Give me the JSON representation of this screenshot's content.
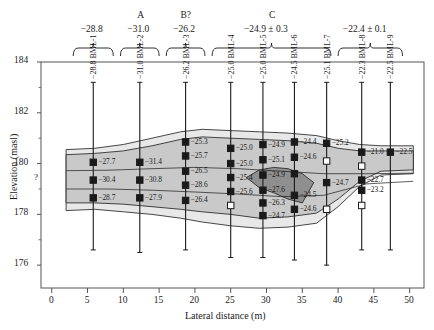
{
  "figure": {
    "type": "geological-cross-section",
    "y_axis": {
      "title": "Elevation (masl)",
      "ticks": [
        176,
        178,
        180,
        182,
        184
      ],
      "min": 175.1,
      "max": 184
    },
    "x_axis": {
      "title": "Lateral distance (m)",
      "ticks": [
        0,
        5,
        10,
        15,
        20,
        25,
        30,
        35,
        40,
        45,
        50
      ],
      "min": -1.5,
      "max": 52
    },
    "uncertainty_marker": "?"
  },
  "groups": [
    {
      "name": "",
      "value": "−28.8",
      "x_start": 3.0,
      "x_end": 8.6
    },
    {
      "name": "A",
      "value": "−31.0",
      "x_start": 9.6,
      "x_end": 15.0
    },
    {
      "name": "B?",
      "value": "−26.2",
      "x_start": 16.0,
      "x_end": 21.4
    },
    {
      "name": "C",
      "value": "−24.9 ± 0.3",
      "x_start": 22.4,
      "x_end": 39.0
    },
    {
      "name": "",
      "value": "−22.4 ± 0.1",
      "x_start": 40.0,
      "x_end": 49.0
    }
  ],
  "boreholes": [
    {
      "id": "BML-1",
      "label": "−28.8 BML-1",
      "x": 5.8,
      "top": 183.2,
      "bottom": 176.6,
      "points": [
        {
          "elev": 180.05,
          "value": "−27.7",
          "open": false
        },
        {
          "elev": 179.35,
          "value": "−30.4",
          "open": false
        },
        {
          "elev": 178.65,
          "value": "−28.7",
          "open": false
        }
      ]
    },
    {
      "id": "BML-2",
      "label": "−31.0 BML-2",
      "x": 12.3,
      "top": 183.2,
      "bottom": 176.5,
      "points": [
        {
          "elev": 180.05,
          "value": "−31.4",
          "open": false
        },
        {
          "elev": 179.35,
          "value": "−30.8",
          "open": false
        },
        {
          "elev": 178.65,
          "value": "−27.9",
          "open": false
        }
      ]
    },
    {
      "id": "BML-3",
      "label": "−26.2 BML-3",
      "x": 18.7,
      "top": 183.2,
      "bottom": 176.6,
      "points": [
        {
          "elev": 180.85,
          "value": "−25.3",
          "open": false
        },
        {
          "elev": 180.3,
          "value": "−25.7",
          "open": false
        },
        {
          "elev": 179.7,
          "value": "−26.5",
          "open": false
        },
        {
          "elev": 179.15,
          "value": "−28.6",
          "open": false
        },
        {
          "elev": 178.55,
          "value": "−26.4",
          "open": false
        }
      ]
    },
    {
      "id": "BML-4",
      "label": "−25.0 BML-4",
      "x": 25.0,
      "top": 183.2,
      "bottom": 176.3,
      "points": [
        {
          "elev": 180.6,
          "value": "−25.0",
          "open": false
        },
        {
          "elev": 180.0,
          "value": "−25.0",
          "open": false
        },
        {
          "elev": 179.45,
          "value": "−25.4",
          "open": false
        },
        {
          "elev": 178.9,
          "value": "−25.6",
          "open": false
        },
        {
          "elev": 178.35,
          "value": "",
          "open": true
        }
      ]
    },
    {
      "id": "BML-5",
      "label": "−25.0 BML-5",
      "x": 29.5,
      "top": 183.2,
      "bottom": 176.3,
      "points": [
        {
          "elev": 180.75,
          "value": "−24.9",
          "open": false
        },
        {
          "elev": 180.15,
          "value": "−25.1",
          "open": false
        },
        {
          "elev": 179.55,
          "value": "−24.9",
          "open": false
        },
        {
          "elev": 178.95,
          "value": "−27.6",
          "open": false
        },
        {
          "elev": 178.45,
          "value": "−26.3",
          "open": false
        },
        {
          "elev": 177.95,
          "value": "−24.7",
          "open": false
        }
      ]
    },
    {
      "id": "BML-6",
      "label": "−24.5 BML-6",
      "x": 33.9,
      "top": 183.2,
      "bottom": 176.2,
      "points": [
        {
          "elev": 180.85,
          "value": "−24.4",
          "open": false
        },
        {
          "elev": 180.25,
          "value": "−24.6",
          "open": false
        },
        {
          "elev": 179.6,
          "value": "",
          "open": false
        },
        {
          "elev": 178.75,
          "value": "−24.5",
          "open": false
        },
        {
          "elev": 178.2,
          "value": "−24.6",
          "open": false
        }
      ]
    },
    {
      "id": "BML-7",
      "label": "−25.1 BML-7",
      "x": 38.4,
      "top": 183.2,
      "bottom": 176.0,
      "points": [
        {
          "elev": 180.8,
          "value": "−25.2",
          "open": false
        },
        {
          "elev": 180.1,
          "value": "",
          "open": true
        },
        {
          "elev": 179.25,
          "value": "−24.7",
          "open": false
        },
        {
          "elev": 178.2,
          "value": "",
          "open": true
        }
      ]
    },
    {
      "id": "BML-8",
      "label": "−22.3 BML-8",
      "x": 43.3,
      "top": 183.2,
      "bottom": 176.6,
      "points": [
        {
          "elev": 180.45,
          "value": "−21.0",
          "open": false
        },
        {
          "elev": 179.9,
          "value": "",
          "open": true
        },
        {
          "elev": 179.35,
          "value": "−22.7",
          "open": false
        },
        {
          "elev": 178.95,
          "value": "−23.2",
          "open": false
        },
        {
          "elev": 178.35,
          "value": "",
          "open": true
        }
      ]
    },
    {
      "id": "BML-9",
      "label": "−22.5 BML-9",
      "x": 47.3,
      "top": 183.2,
      "bottom": 176.6,
      "points": [
        {
          "elev": 180.45,
          "value": "−22.5",
          "open": false
        }
      ]
    }
  ],
  "colors": {
    "outer_fill": "#e8e8e8",
    "mid_fill": "#c9c9c9",
    "core_fill": "#8f8f8f",
    "line": "#1a1a1a",
    "axis": "#555555"
  }
}
